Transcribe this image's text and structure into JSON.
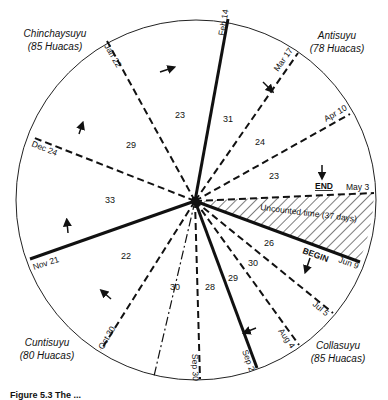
{
  "diagram": {
    "regions": [
      {
        "name": "Chinchaysuyu",
        "count": "(85 Huacas)"
      },
      {
        "name": "Antisuyu",
        "count": "(78 Huacas)"
      },
      {
        "name": "Collasuyu",
        "count": "(85 Huacas)"
      },
      {
        "name": "Cuntisuyu",
        "count": "(80 Huacas)"
      }
    ],
    "dates": [
      "Feb 14",
      "Mar 17",
      "Apr 10",
      "May 3",
      "Jun 9",
      "Jul 5",
      "Aug 4",
      "Sep 2",
      "Sep 30",
      "Oct 30",
      "Nov 21",
      "Dec 24",
      "Jan 22"
    ],
    "segment_days": [
      "31",
      "24",
      "23",
      "26",
      "30",
      "29",
      "28",
      "30",
      "22",
      "33",
      "29",
      "23"
    ],
    "uncounted": "Uncounted time (37 days)",
    "markers": {
      "end": "END",
      "begin": "BEGIN"
    },
    "caption": "Figure 5.3 The ..."
  }
}
